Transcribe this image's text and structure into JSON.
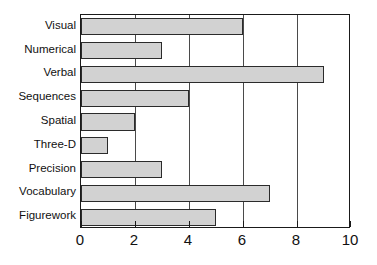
{
  "chart_data": {
    "type": "bar",
    "orientation": "horizontal",
    "title": "",
    "subtitle": "",
    "xlabel": "",
    "ylabel": "",
    "categories": [
      "Visual",
      "Numerical",
      "Verbal",
      "Sequences",
      "Spatial",
      "Three-D",
      "Precision",
      "Vocabulary",
      "Figurework"
    ],
    "values": [
      6,
      3,
      9,
      4,
      2,
      1,
      3,
      7,
      5
    ],
    "xlim": [
      0,
      10
    ],
    "xticks": [
      0,
      2,
      4,
      6,
      8,
      10
    ],
    "xtick_labels": [
      "0",
      "2",
      "4",
      "6",
      "8",
      "10"
    ],
    "grid": "vertical-major",
    "legend": "none",
    "annotations": [],
    "colors": {
      "bar_fill": "#d2d2d2",
      "bar_edge": "#2b2b2b",
      "axis": "#1a1a1a",
      "gridline": "#4a4a4a",
      "text": "#111111",
      "background": "#ffffff"
    }
  }
}
